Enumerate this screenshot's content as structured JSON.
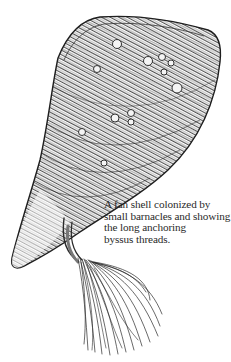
{
  "figure": {
    "colors": {
      "ink": "#1e1e1e",
      "paper": "#ffffff",
      "shade": "#6a6a6a"
    }
  },
  "caption": {
    "lines": [
      "A fan shell colonized by",
      "small barnacles and showing",
      "the long anchoring",
      "byssus threads."
    ]
  }
}
